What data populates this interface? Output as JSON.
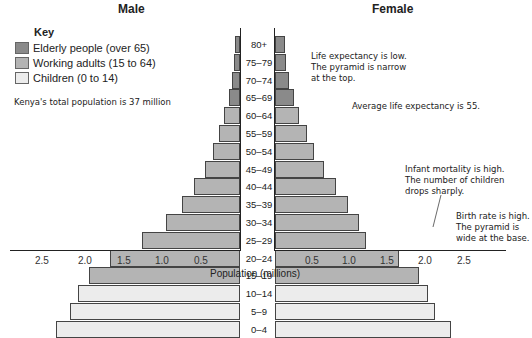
{
  "chart_data": {
    "type": "bar",
    "subtype": "population-pyramid",
    "title_left": "Male",
    "title_right": "Female",
    "xlabel": "Population (millions)",
    "x_ticks": [
      "2.5",
      "2.0",
      "1.5",
      "1.0",
      "0.5",
      "0.5",
      "1.0",
      "1.5",
      "2.0",
      "2.5"
    ],
    "xlim": [
      0,
      2.7
    ],
    "categories": [
      "80+",
      "75–79",
      "70–74",
      "65–69",
      "60–64",
      "55–59",
      "50–54",
      "45–49",
      "40–44",
      "35–39",
      "30–34",
      "25–29",
      "20–24",
      "15–19",
      "10–14",
      "5–9",
      "0–4"
    ],
    "series": [
      {
        "name": "Male",
        "values": [
          0.06,
          0.08,
          0.1,
          0.14,
          0.2,
          0.27,
          0.35,
          0.45,
          0.59,
          0.74,
          0.95,
          1.26,
          1.67,
          1.94,
          2.08,
          2.18,
          2.36
        ]
      },
      {
        "name": "Female",
        "values": [
          0.13,
          0.15,
          0.19,
          0.25,
          0.32,
          0.42,
          0.51,
          0.64,
          0.8,
          0.96,
          1.11,
          1.2,
          1.63,
          1.89,
          2.01,
          2.1,
          2.32
        ]
      }
    ],
    "groups": [
      {
        "name": "Elderly people (over 65)",
        "categories": [
          "80+",
          "75–79",
          "70–74",
          "65–69"
        ],
        "color": "#8a8a8a"
      },
      {
        "name": "Working adults (15 to 64)",
        "categories": [
          "60–64",
          "55–59",
          "50–54",
          "45–49",
          "40–44",
          "35–39",
          "30–34",
          "25–29",
          "20–24",
          "15–19"
        ],
        "color": "#b4b4b4"
      },
      {
        "name": "Children (0 to 14)",
        "categories": [
          "10–14",
          "5–9",
          "0–4"
        ],
        "color": "#ececec"
      }
    ],
    "legend": {
      "title": "Key",
      "position": "top-left"
    },
    "annotations": [
      "Kenya's total population is 37 million",
      "Life expectancy is low. The pyramid is narrow at the top.",
      "Average life expectancy is 55.",
      "Infant mortality is high. The number of children drops sharply.",
      "Birth rate is high. The pyramid is wide at the base."
    ],
    "grid": false
  },
  "labels": {
    "male": "Male",
    "female": "Female",
    "key": "Key",
    "legend": [
      "Elderly people (over 65)",
      "Working adults (15 to 64)",
      "Children (0 to 14)"
    ],
    "xlabel": "Population (millions)",
    "note_total": "Kenya's total population is 37 million",
    "note_life_1": "Life expectancy is low.",
    "note_life_2": "The pyramid is narrow",
    "note_life_3": "at the top.",
    "note_avg": "Average life expectancy is 55.",
    "note_infant_1": "Infant mortality is high.",
    "note_infant_2": "The number of children",
    "note_infant_3": "drops sharply.",
    "note_birth_1": "Birth rate is high.",
    "note_birth_2": "The pyramid is",
    "note_birth_3": "wide at the base."
  },
  "colors": {
    "elderly": "#8a8a8a",
    "working": "#b4b4b4",
    "children": "#ececec"
  }
}
